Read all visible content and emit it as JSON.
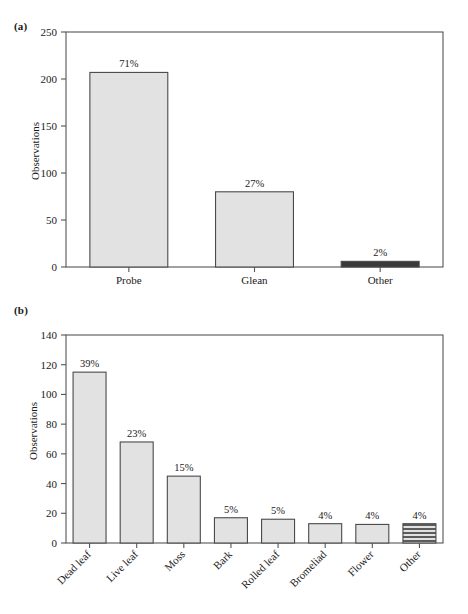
{
  "figure": {
    "panels": [
      {
        "tag": "(a)",
        "ylabel": "Observations",
        "chart_key": "chart_a"
      },
      {
        "tag": "(b)",
        "ylabel": "Observations",
        "chart_key": "chart_b"
      }
    ]
  },
  "chart_data": [
    {
      "type": "bar",
      "panel": "(a)",
      "title": "",
      "xlabel": "",
      "ylabel": "Observations",
      "ylim": [
        0,
        250
      ],
      "yticks": [
        0,
        50,
        100,
        150,
        200,
        250
      ],
      "ytick_labels": [
        "0",
        "50",
        "100",
        "150",
        "200",
        "250"
      ],
      "grid": false,
      "legend": "none",
      "categories": [
        "Probe",
        "Glean",
        "Other"
      ],
      "values": [
        207,
        80,
        6
      ],
      "data_labels": [
        "71%",
        "27%",
        "2%"
      ],
      "bar_styles": [
        "solid-light-gray",
        "solid-light-gray",
        "solid-dark"
      ],
      "colors": {
        "bar_fill": "#e2e2e2",
        "bar_fill_dark": "#3a3a3a",
        "bar_edge": "#4a4a4a",
        "axis": "#555555",
        "text": "#1a1a1a"
      }
    },
    {
      "type": "bar",
      "panel": "(b)",
      "title": "",
      "xlabel": "",
      "ylabel": "Observations",
      "ylim": [
        0,
        140
      ],
      "yticks": [
        0,
        20,
        40,
        60,
        80,
        100,
        120,
        140
      ],
      "ytick_labels": [
        "0",
        "20",
        "40",
        "60",
        "80",
        "100",
        "120",
        "140"
      ],
      "grid": false,
      "legend": "none",
      "categories": [
        "Dead leaf",
        "Live leaf",
        "Moss",
        "Bark",
        "Rolled leaf",
        "Bromeliad",
        "Flower",
        "Other"
      ],
      "values": [
        115,
        68,
        45,
        17,
        16,
        13,
        12.5,
        13
      ],
      "data_labels": [
        "39%",
        "23%",
        "15%",
        "5%",
        "5%",
        "4%",
        "4%",
        "4%"
      ],
      "bar_styles": [
        "solid-light-gray",
        "solid-light-gray",
        "solid-light-gray",
        "solid-light-gray",
        "solid-light-gray",
        "solid-light-gray",
        "solid-light-gray",
        "horizontal-hatch"
      ],
      "colors": {
        "bar_fill": "#e2e2e2",
        "bar_edge": "#4a4a4a",
        "hatch_line": "#3a3a3a",
        "axis": "#555555",
        "text": "#1a1a1a"
      }
    }
  ]
}
